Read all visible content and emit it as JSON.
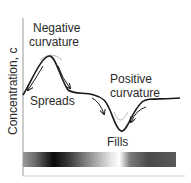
{
  "diagram": {
    "y_axis_label": "Concentration, c",
    "labels": {
      "negative_line1": "Negative",
      "negative_line2": "curvature",
      "spreads": "Spreads",
      "positive_line1": "Positive",
      "positive_line2": "curvature",
      "fills": "Fills"
    },
    "colors": {
      "curve": "#1a1a1a",
      "previous_curve": "#b8b8b8",
      "axis": "#888888",
      "text": "#2a2a2a"
    }
  }
}
